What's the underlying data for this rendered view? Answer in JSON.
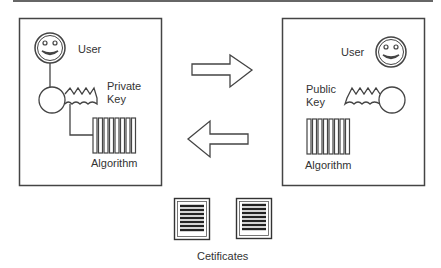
{
  "diagram": {
    "type": "public-key-cryptography",
    "left_panel": {
      "user_label": "User",
      "key_label_line1": "Private",
      "key_label_line2": "Key",
      "algorithm_label": "Algorithm"
    },
    "right_panel": {
      "user_label": "User",
      "key_label_line1": "Public",
      "key_label_line2": "Key",
      "algorithm_label": "Algorithm"
    },
    "arrows": [
      {
        "direction": "right",
        "from": "left_panel",
        "to": "right_panel"
      },
      {
        "direction": "left",
        "from": "right_panel",
        "to": "left_panel"
      }
    ],
    "certificates": {
      "label": "Cetificates",
      "count": 2
    },
    "colors": {
      "stroke": "#444444",
      "text": "#333333",
      "background": "#ffffff"
    }
  }
}
